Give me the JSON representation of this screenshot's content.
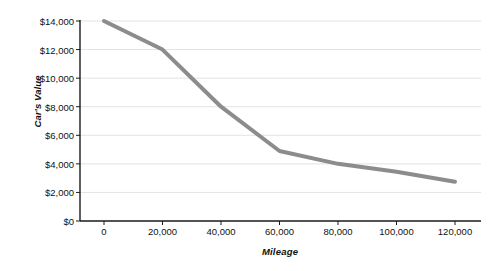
{
  "chart_data": {
    "type": "line",
    "title": "",
    "xlabel": "Mileage",
    "ylabel": "Car's Value",
    "x": [
      0,
      20000,
      40000,
      60000,
      80000,
      100000,
      120000
    ],
    "values": [
      14000,
      12000,
      8000,
      4900,
      4000,
      3450,
      2750
    ],
    "series": [
      {
        "name": "Car's Value",
        "values": [
          14000,
          12000,
          8000,
          4900,
          4000,
          3450,
          2750
        ],
        "color": "#8c8c8c"
      }
    ],
    "xlim": [
      0,
      120000
    ],
    "ylim": [
      0,
      14000
    ],
    "x_tick_labels": [
      "0",
      "20,000",
      "40,000",
      "60,000",
      "80,000",
      "100,000",
      "120,000"
    ],
    "y_tick_values": [
      0,
      2000,
      4000,
      6000,
      8000,
      10000,
      12000,
      14000
    ],
    "y_tick_labels": [
      "$0",
      "$2,000",
      "$4,000",
      "$6,000",
      "$8,000",
      "$10,000",
      "$12,000",
      "$14,000"
    ],
    "grid": "horizontal",
    "legend": "none",
    "line_color": "#8c8c8c",
    "grid_color": "#e3e3e3",
    "axis_color": "#1a1a1a",
    "background": "#ffffff"
  }
}
